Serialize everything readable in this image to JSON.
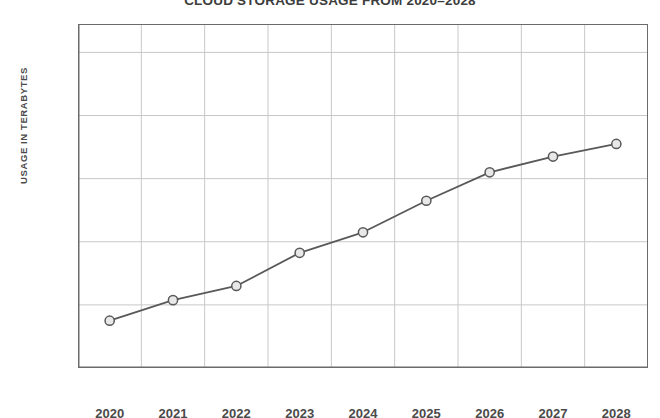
{
  "chart_data": {
    "type": "line",
    "title": "CLOUD STORAGE USAGE FROM 2020–2028",
    "xlabel": "",
    "ylabel": "USAGE IN TERABYTES",
    "categories": [
      "2020",
      "2021",
      "2022",
      "2023",
      "2024",
      "2025",
      "2026",
      "2027",
      "2028"
    ],
    "values": [
      150,
      215,
      260,
      365,
      430,
      530,
      620,
      670,
      710
    ],
    "series": [
      {
        "name": "Usage in terabytes",
        "values": [
          150,
          215,
          260,
          365,
          430,
          530,
          620,
          670,
          710
        ]
      }
    ],
    "ylim": [
      0,
      1090
    ],
    "ytick_values": [
      200,
      400,
      600,
      800,
      1000
    ],
    "ytick_labels": [
      "200",
      "400",
      "600",
      "800",
      "1k"
    ],
    "grid": true,
    "legend": "none",
    "colors": {
      "line": "#595959",
      "marker_fill": "#e8e8e8",
      "marker_stroke": "#595959",
      "grid": "#c8c8c8",
      "axis": "#6b6b6b",
      "text": "#4a4a4a",
      "title": "#3d3d3d",
      "background": "#ffffff"
    }
  }
}
